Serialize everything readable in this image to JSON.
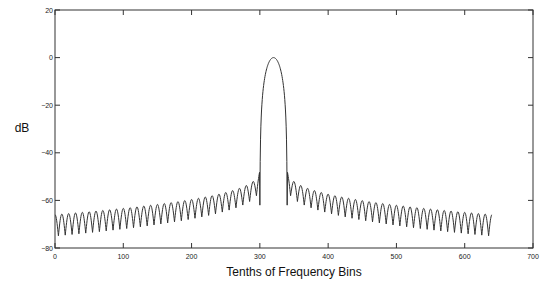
{
  "chart_data": {
    "type": "line",
    "title": "",
    "xlabel": "Tenths of Frequency Bins",
    "ylabel": "dB",
    "xlim": [
      0,
      700
    ],
    "ylim": [
      -80,
      20
    ],
    "xticks": [
      0,
      100,
      200,
      300,
      400,
      500,
      600,
      700
    ],
    "yticks": [
      20,
      0,
      -20,
      -40,
      -60,
      -80
    ],
    "xtick_labels": [
      "0",
      "100",
      "200",
      "300",
      "400",
      "500",
      "600",
      "700"
    ],
    "ytick_labels": [
      "20",
      "0",
      "-20",
      "-40",
      "-60",
      "-80"
    ],
    "grid": false,
    "legend": null,
    "series": [
      {
        "name": "spectrum",
        "color": "#333333",
        "x_range": [
          0,
          640
        ],
        "peak_x": 320,
        "peak_db": 0,
        "mainlobe_halfwidth": 20,
        "sidelobe_period": 10,
        "first_sidelobe_db": -46,
        "far_sidelobe_peak_db": -66,
        "sidelobe_null_db": -74,
        "points": [
          {
            "x": 0,
            "y": -67
          },
          {
            "x": 5,
            "y": -73
          },
          {
            "x": 100,
            "y": -67
          },
          {
            "x": 105,
            "y": -73
          },
          {
            "x": 200,
            "y": -63
          },
          {
            "x": 205,
            "y": -72
          },
          {
            "x": 260,
            "y": -58
          },
          {
            "x": 280,
            "y": -54
          },
          {
            "x": 290,
            "y": -50
          },
          {
            "x": 295,
            "y": -46
          },
          {
            "x": 300,
            "y": -30
          },
          {
            "x": 310,
            "y": -6
          },
          {
            "x": 320,
            "y": 0
          },
          {
            "x": 330,
            "y": -6
          },
          {
            "x": 340,
            "y": -30
          },
          {
            "x": 345,
            "y": -46
          },
          {
            "x": 350,
            "y": -50
          },
          {
            "x": 360,
            "y": -54
          },
          {
            "x": 380,
            "y": -58
          },
          {
            "x": 435,
            "y": -72
          },
          {
            "x": 440,
            "y": -63
          },
          {
            "x": 535,
            "y": -73
          },
          {
            "x": 540,
            "y": -67
          },
          {
            "x": 635,
            "y": -73
          },
          {
            "x": 640,
            "y": -67
          }
        ]
      }
    ]
  },
  "plot_area": {
    "left": 55,
    "top": 10,
    "right": 533,
    "bottom": 248
  },
  "colors": {
    "line": "#333333",
    "axis": "#333333",
    "background": "#ffffff"
  }
}
